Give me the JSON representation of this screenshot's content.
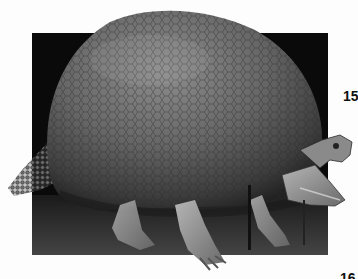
{
  "image": {
    "subject": "Glyptodon fossil skeleton with domed armored carapace, armored tail, skull and bony legs, museum mount",
    "style": "grayscale halftone photograph on book page",
    "colors": {
      "page": "#fdfdfd",
      "backdrop": "#0a0a0a",
      "floor": "#3a3a3a",
      "shell_light": "#8a8a8a",
      "shell_mid": "#5e5e5e",
      "shell_dark": "#2c2c2c",
      "bone": "#9a9a9a",
      "bone_light": "#c8c8c8"
    }
  },
  "page_numbers": {
    "top": "15",
    "bottom": "16"
  }
}
